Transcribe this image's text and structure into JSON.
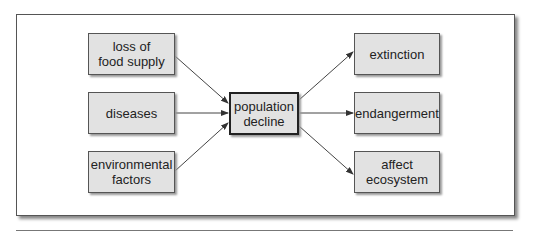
{
  "diagram": {
    "causes": [
      {
        "id": "food",
        "label": "loss of\nfood supply"
      },
      {
        "id": "diseases",
        "label": "diseases"
      },
      {
        "id": "env",
        "label": "environmental\nfactors"
      }
    ],
    "center": {
      "id": "decline",
      "label": "population\ndecline"
    },
    "effects": [
      {
        "id": "extinction",
        "label": "extinction"
      },
      {
        "id": "endangerment",
        "label": "endangerment"
      },
      {
        "id": "ecosystem",
        "label": "affect\necosystem"
      }
    ],
    "edges": [
      [
        "food",
        "decline"
      ],
      [
        "diseases",
        "decline"
      ],
      [
        "env",
        "decline"
      ],
      [
        "decline",
        "extinction"
      ],
      [
        "decline",
        "endangerment"
      ],
      [
        "decline",
        "ecosystem"
      ]
    ]
  }
}
